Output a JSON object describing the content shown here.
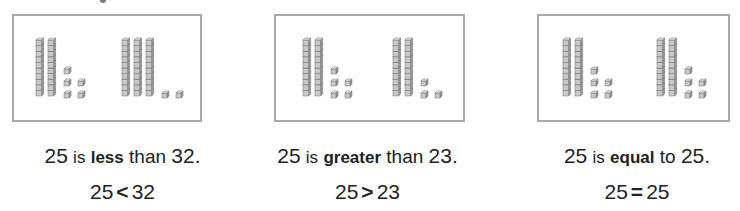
{
  "colors": {
    "border": "#a9a9a9",
    "block_fill": "#c8c8c8",
    "block_top": "#e6e6e6",
    "block_side": "#9a9a9a",
    "block_stroke": "#6f6f6f",
    "text": "#222222"
  },
  "panels": [
    {
      "id": "less",
      "box": {
        "left": 12,
        "width": 190
      },
      "groups": [
        {
          "number": 25,
          "tens": 2,
          "ones": 5,
          "x": 22
        },
        {
          "number": 32,
          "tens": 3,
          "ones": 2,
          "x": 108
        }
      ],
      "sentence": {
        "left_num": "25",
        "is": "is",
        "keyword": "less",
        "connector": "than",
        "right_num": "32."
      },
      "equation": {
        "left": "25",
        "symbol": "<",
        "right": "32"
      },
      "center": 120
    },
    {
      "id": "greater",
      "box": {
        "left": 274,
        "width": 191
      },
      "groups": [
        {
          "number": 25,
          "tens": 2,
          "ones": 5,
          "x": 27
        },
        {
          "number": 23,
          "tens": 2,
          "ones": 3,
          "x": 117
        }
      ],
      "sentence": {
        "left_num": "25",
        "is": "is",
        "keyword": "greater",
        "connector": "than",
        "right_num": "23."
      },
      "equation": {
        "left": "25",
        "symbol": ">",
        "right": "23"
      },
      "center": 366
    },
    {
      "id": "equal",
      "box": {
        "left": 537,
        "width": 193
      },
      "groups": [
        {
          "number": 25,
          "tens": 2,
          "ones": 5,
          "x": 24
        },
        {
          "number": 25,
          "tens": 2,
          "ones": 5,
          "x": 118
        }
      ],
      "sentence": {
        "left_num": "25",
        "is": "is",
        "keyword": "equal",
        "connector": "to",
        "right_num": "25."
      },
      "equation": {
        "left": "25",
        "symbol": "=",
        "right": "25"
      },
      "center": 640
    }
  ]
}
